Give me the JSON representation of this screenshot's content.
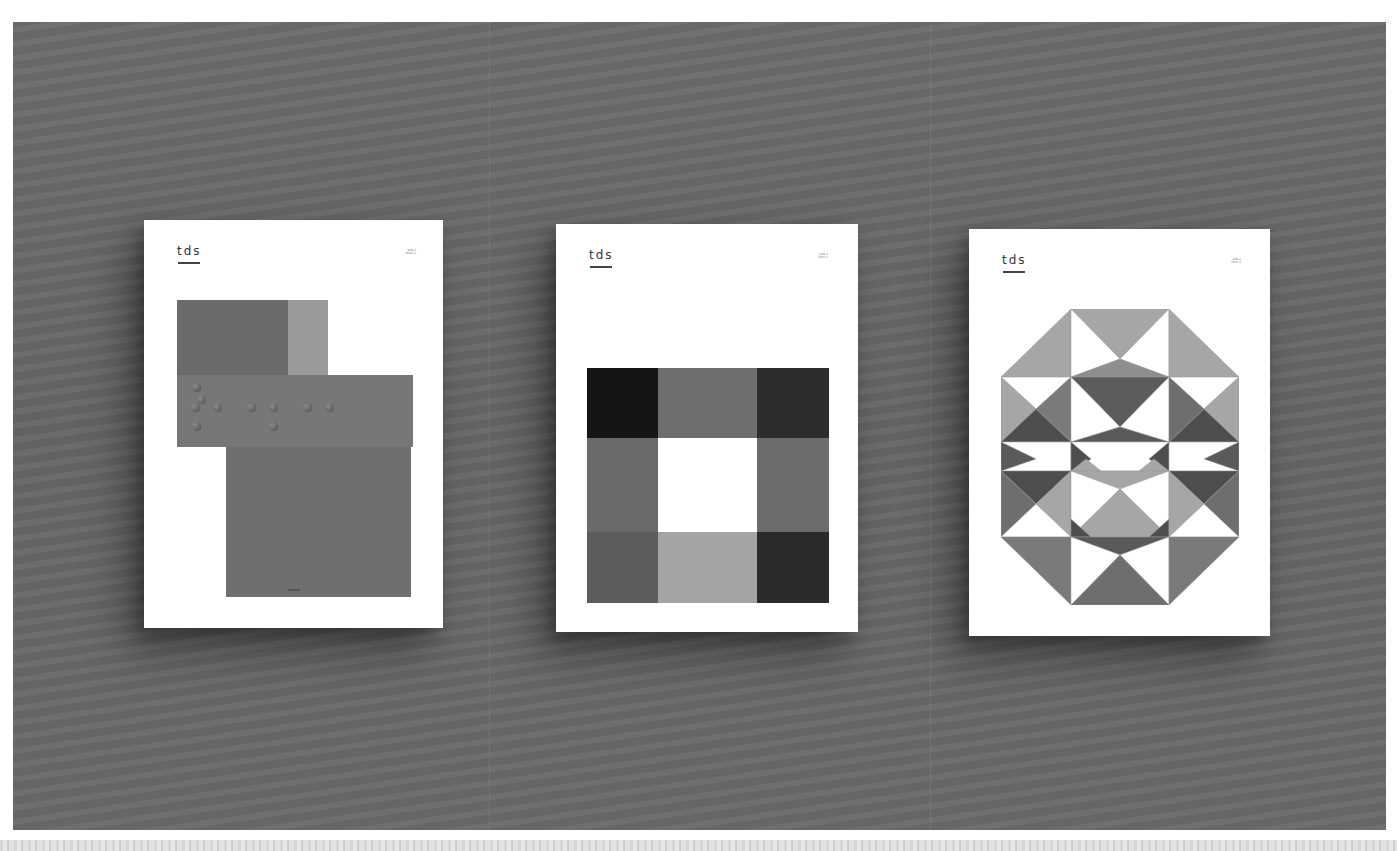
{
  "scene": {
    "description": "Three square-format posters mounted on a gray textured wall",
    "wall_color": "#686868",
    "strip_color": "#dcdcdc"
  },
  "posters": [
    {
      "brand": "tds",
      "issue_lines": [
        "alfa 1",
        "braill 1"
      ],
      "artwork": "braille",
      "colors": {
        "top_left_block": "#6b6b6b",
        "top_right_block": "#9a9a9a",
        "band": "#777777",
        "lower_block": "#6f6f6f"
      },
      "braille_dots": [
        [
          1,
          0
        ],
        [
          0,
          1
        ],
        [
          1,
          1
        ],
        [
          0,
          2
        ],
        [
          3,
          1
        ],
        [
          4,
          1
        ],
        [
          4,
          2
        ],
        [
          6,
          1
        ],
        [
          7,
          1
        ]
      ]
    },
    {
      "brand": "tds",
      "issue_lines": [
        "alfa 1",
        "form 2"
      ],
      "artwork": "nine-grid",
      "grid_colors": [
        "#151515",
        "#6e6e6e",
        "#2c2c2c",
        "#6a6a6a",
        "#ffffff",
        "#6c6c6c",
        "#5c5c5c",
        "#a4a4a4",
        "#2a2a2a"
      ]
    },
    {
      "brand": "tds",
      "issue_lines": [
        "alfa 1",
        "form 3"
      ],
      "artwork": "octagon-triangles",
      "palette": {
        "light": "#a6a6a6",
        "mid": "#7a7a7a",
        "dark": "#4e4e4e",
        "white": "#ffffff"
      }
    }
  ]
}
